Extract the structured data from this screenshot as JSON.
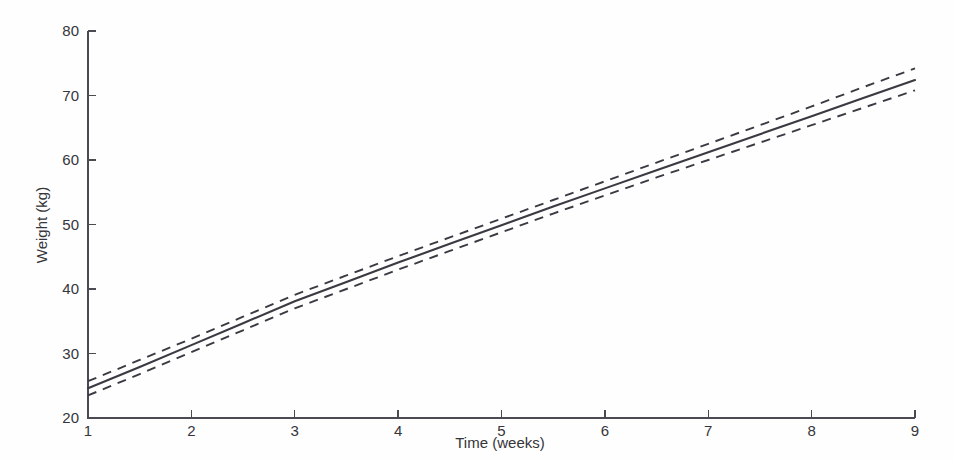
{
  "chart_data": {
    "type": "line",
    "title": "",
    "subtitle": "",
    "xlabel": "Time (weeks)",
    "ylabel": "Weight (kg)",
    "xlim": [
      1,
      9
    ],
    "ylim": [
      20,
      80
    ],
    "xticks": [
      1,
      2,
      3,
      4,
      5,
      6,
      7,
      8,
      9
    ],
    "yticks": [
      20,
      30,
      40,
      50,
      60,
      70,
      80
    ],
    "xtick_labels": [
      "1",
      "2",
      "3",
      "4",
      "5",
      "6",
      "7",
      "8",
      "9"
    ],
    "ytick_labels": [
      "20",
      "30",
      "40",
      "50",
      "60",
      "70",
      "80"
    ],
    "grid": false,
    "legend": null,
    "legend_position": "none",
    "x": [
      1,
      1.5,
      2,
      2.5,
      3,
      3.5,
      4,
      4.5,
      5,
      5.5,
      6,
      6.5,
      7,
      7.5,
      8,
      8.5,
      9
    ],
    "series": [
      {
        "name": "Fitted mean weight",
        "style": "solid",
        "color": "#3a3a42",
        "values": [
          24.6,
          27.9,
          31.3,
          34.7,
          38.1,
          41.1,
          44.1,
          47.0,
          49.9,
          52.8,
          55.6,
          58.4,
          61.2,
          64.0,
          66.8,
          69.6,
          72.4
        ]
      },
      {
        "name": "Upper confidence limit",
        "style": "dashed",
        "color": "#3a3a42",
        "values": [
          25.7,
          29.0,
          32.3,
          35.7,
          39.1,
          42.1,
          45.1,
          48.0,
          50.9,
          53.8,
          56.7,
          59.6,
          62.5,
          65.4,
          68.3,
          71.3,
          74.2
        ]
      },
      {
        "name": "Lower confidence limit",
        "style": "dashed",
        "color": "#3a3a42",
        "values": [
          23.5,
          26.8,
          30.2,
          33.6,
          37.0,
          40.0,
          43.0,
          45.9,
          48.8,
          51.7,
          54.5,
          57.3,
          60.0,
          62.7,
          65.4,
          68.1,
          70.8
        ]
      }
    ],
    "annotations": []
  },
  "axes": {
    "y_axis_title": "Weight (kg)",
    "x_axis_title": "Time (weeks)"
  },
  "colors": {
    "background": "#fefefe",
    "axis": "#4a4a52",
    "line": "#3a3a42",
    "text": "#35353a"
  }
}
